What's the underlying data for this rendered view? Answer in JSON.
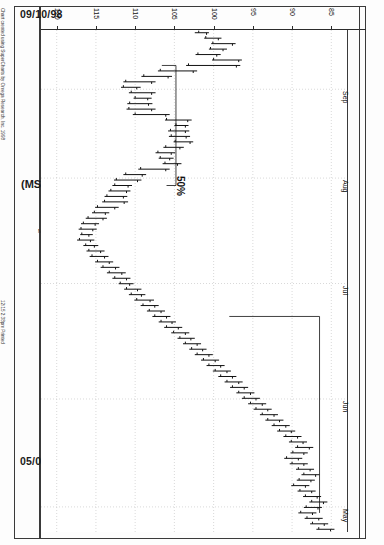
{
  "page": {
    "date_top": "09/10/98",
    "date_bottom": "05/01/98",
    "chart_title": "(MSFT) Microsoft Corp",
    "quote_line": "Microsoft Corp-Daily  12/14/98  C=127.898  -6.062  O=132.750  H=133.750  L=127.688  V=16016000",
    "copyright_a": "Chart created using SuperCharts by Omega Research, Inc. 1998",
    "copyright_b": "12/15  2:38pm  Printed"
  },
  "annotations": [
    {
      "name": "retracement-50-label",
      "text": "50%"
    }
  ],
  "chart_data": {
    "type": "bar",
    "title": "(MSFT) Microsoft Corp",
    "subtitle": "Microsoft Corp-Daily",
    "xlabel": "Date",
    "ylabel": "Price",
    "orientation": "rotated-90",
    "grid": true,
    "legend": "none",
    "price_axis": {
      "position": "top",
      "ticks": [
        120,
        115,
        110,
        105,
        100,
        95,
        90,
        85
      ],
      "limits": [
        122,
        83
      ],
      "direction": "descending-left-to-right"
    },
    "time_axis": {
      "position": "right",
      "start": "05/01/98",
      "end": "09/10/98",
      "month_ticks": [
        "Sep",
        "Aug",
        "Jul",
        "Jun",
        "May"
      ]
    },
    "quote": {
      "symbol": "MSFT",
      "name": "Microsoft Corp",
      "interval": "Daily",
      "date": "12/14/98",
      "close": 127.898,
      "change": -6.062,
      "open": 132.75,
      "high": 133.75,
      "low": 127.688,
      "volume": 16016000
    },
    "bars": [
      {
        "d": "09/10",
        "h": 102.4,
        "l": 100.6,
        "o": 101.9,
        "c": 100.9
      },
      {
        "d": "09/09",
        "h": 101.2,
        "l": 99.0,
        "o": 101.0,
        "c": 99.4
      },
      {
        "d": "09/08",
        "h": 100.3,
        "l": 97.2,
        "o": 100.1,
        "c": 97.6
      },
      {
        "d": "09/04",
        "h": 100.6,
        "l": 98.3,
        "o": 100.4,
        "c": 98.8
      },
      {
        "d": "09/03",
        "h": 102.3,
        "l": 99.1,
        "o": 102.0,
        "c": 99.6
      },
      {
        "d": "09/02",
        "h": 100.2,
        "l": 96.4,
        "o": 100.0,
        "c": 96.8
      },
      {
        "d": "09/01",
        "h": 103.5,
        "l": 96.6,
        "o": 103.2,
        "c": 97.1
      },
      {
        "d": "08/31",
        "h": 107.1,
        "l": 102.1,
        "o": 106.8,
        "c": 102.6
      },
      {
        "d": "08/28",
        "h": 109.2,
        "l": 105.3,
        "o": 108.9,
        "c": 105.8
      },
      {
        "d": "08/27",
        "h": 111.5,
        "l": 107.4,
        "o": 111.2,
        "c": 107.9
      },
      {
        "d": "08/26",
        "h": 111.8,
        "l": 109.3,
        "o": 111.5,
        "c": 109.8
      },
      {
        "d": "08/25",
        "h": 110.8,
        "l": 107.4,
        "o": 110.5,
        "c": 107.9
      },
      {
        "d": "08/24",
        "h": 110.2,
        "l": 107.9,
        "o": 110.0,
        "c": 108.4
      },
      {
        "d": "08/21",
        "h": 111.0,
        "l": 107.8,
        "o": 110.7,
        "c": 108.3
      },
      {
        "d": "08/20",
        "h": 111.1,
        "l": 107.4,
        "o": 110.8,
        "c": 107.9
      },
      {
        "d": "08/19",
        "h": 110.3,
        "l": 105.6,
        "o": 110.0,
        "c": 106.1
      },
      {
        "d": "08/18",
        "h": 106.2,
        "l": 102.8,
        "o": 106.0,
        "c": 103.3
      },
      {
        "d": "08/17",
        "h": 105.0,
        "l": 103.2,
        "o": 104.8,
        "c": 103.6
      },
      {
        "d": "08/14",
        "h": 105.8,
        "l": 103.1,
        "o": 105.5,
        "c": 103.6
      },
      {
        "d": "08/13",
        "h": 105.7,
        "l": 103.0,
        "o": 105.4,
        "c": 103.5
      },
      {
        "d": "08/12",
        "h": 105.1,
        "l": 102.6,
        "o": 104.9,
        "c": 103.0
      },
      {
        "d": "08/11",
        "h": 106.4,
        "l": 103.8,
        "o": 106.1,
        "c": 104.3
      },
      {
        "d": "08/10",
        "h": 107.4,
        "l": 104.9,
        "o": 107.1,
        "c": 105.4
      },
      {
        "d": "08/07",
        "h": 107.0,
        "l": 105.1,
        "o": 106.8,
        "c": 105.6
      },
      {
        "d": "08/06",
        "h": 106.5,
        "l": 104.1,
        "o": 106.2,
        "c": 104.6
      },
      {
        "d": "08/05",
        "h": 109.6,
        "l": 105.6,
        "o": 109.3,
        "c": 106.1
      },
      {
        "d": "08/04",
        "h": 111.5,
        "l": 108.6,
        "o": 111.2,
        "c": 109.1
      },
      {
        "d": "08/03",
        "h": 112.7,
        "l": 109.2,
        "o": 112.4,
        "c": 109.7
      },
      {
        "d": "07/31",
        "h": 112.9,
        "l": 110.4,
        "o": 112.6,
        "c": 110.9
      },
      {
        "d": "07/30",
        "h": 113.4,
        "l": 110.6,
        "o": 113.1,
        "c": 111.1
      },
      {
        "d": "07/29",
        "h": 113.9,
        "l": 111.0,
        "o": 113.6,
        "c": 111.5
      },
      {
        "d": "07/28",
        "h": 114.2,
        "l": 110.9,
        "o": 113.9,
        "c": 111.4
      },
      {
        "d": "07/27",
        "h": 115.1,
        "l": 112.1,
        "o": 114.8,
        "c": 112.6
      },
      {
        "d": "07/24",
        "h": 115.5,
        "l": 113.3,
        "o": 115.2,
        "c": 113.8
      },
      {
        "d": "07/23",
        "h": 116.3,
        "l": 113.6,
        "o": 116.0,
        "c": 114.1
      },
      {
        "d": "07/22",
        "h": 116.9,
        "l": 114.6,
        "o": 116.6,
        "c": 115.1
      },
      {
        "d": "07/21",
        "h": 117.2,
        "l": 114.9,
        "o": 116.9,
        "c": 115.4
      },
      {
        "d": "07/20",
        "h": 117.0,
        "l": 115.4,
        "o": 116.8,
        "c": 115.9
      },
      {
        "d": "07/17",
        "h": 117.4,
        "l": 115.2,
        "o": 117.1,
        "c": 115.7
      },
      {
        "d": "07/16",
        "h": 116.6,
        "l": 114.7,
        "o": 116.3,
        "c": 115.2
      },
      {
        "d": "07/15",
        "h": 116.2,
        "l": 113.9,
        "o": 115.9,
        "c": 114.4
      },
      {
        "d": "07/14",
        "h": 115.8,
        "l": 113.4,
        "o": 115.5,
        "c": 113.9
      },
      {
        "d": "07/13",
        "h": 115.1,
        "l": 112.8,
        "o": 114.8,
        "c": 113.3
      },
      {
        "d": "07/10",
        "h": 114.4,
        "l": 112.0,
        "o": 114.1,
        "c": 112.5
      },
      {
        "d": "07/09",
        "h": 113.6,
        "l": 111.2,
        "o": 113.3,
        "c": 111.7
      },
      {
        "d": "07/08",
        "h": 112.9,
        "l": 110.6,
        "o": 112.6,
        "c": 111.1
      },
      {
        "d": "07/07",
        "h": 112.1,
        "l": 110.2,
        "o": 111.9,
        "c": 110.7
      },
      {
        "d": "07/06",
        "h": 111.4,
        "l": 109.2,
        "o": 111.1,
        "c": 109.7
      },
      {
        "d": "07/02",
        "h": 110.8,
        "l": 108.7,
        "o": 110.5,
        "c": 109.2
      },
      {
        "d": "07/01",
        "h": 110.1,
        "l": 107.6,
        "o": 109.8,
        "c": 108.1
      },
      {
        "d": "06/30",
        "h": 109.3,
        "l": 107.0,
        "o": 109.0,
        "c": 107.5
      },
      {
        "d": "06/29",
        "h": 108.5,
        "l": 106.2,
        "o": 108.2,
        "c": 106.7
      },
      {
        "d": "06/26",
        "h": 107.8,
        "l": 105.5,
        "o": 107.5,
        "c": 106.0
      },
      {
        "d": "06/25",
        "h": 107.0,
        "l": 104.8,
        "o": 106.7,
        "c": 105.3
      },
      {
        "d": "06/24",
        "h": 106.3,
        "l": 104.0,
        "o": 106.0,
        "c": 104.5
      },
      {
        "d": "06/23",
        "h": 105.4,
        "l": 103.1,
        "o": 105.1,
        "c": 103.6
      },
      {
        "d": "06/22",
        "h": 104.6,
        "l": 102.4,
        "o": 104.3,
        "c": 102.9
      },
      {
        "d": "06/19",
        "h": 103.9,
        "l": 101.6,
        "o": 103.6,
        "c": 102.1
      },
      {
        "d": "06/18",
        "h": 103.1,
        "l": 100.9,
        "o": 102.8,
        "c": 101.4
      },
      {
        "d": "06/17",
        "h": 102.4,
        "l": 100.1,
        "o": 102.1,
        "c": 100.6
      },
      {
        "d": "06/16",
        "h": 101.6,
        "l": 99.3,
        "o": 101.3,
        "c": 99.8
      },
      {
        "d": "06/15",
        "h": 100.9,
        "l": 98.6,
        "o": 100.6,
        "c": 99.1
      },
      {
        "d": "06/12",
        "h": 100.1,
        "l": 97.8,
        "o": 99.8,
        "c": 98.3
      },
      {
        "d": "06/11",
        "h": 99.4,
        "l": 97.1,
        "o": 99.1,
        "c": 97.6
      },
      {
        "d": "06/10",
        "h": 98.6,
        "l": 96.3,
        "o": 98.3,
        "c": 96.8
      },
      {
        "d": "06/09",
        "h": 97.9,
        "l": 95.6,
        "o": 97.6,
        "c": 96.1
      },
      {
        "d": "06/08",
        "h": 97.1,
        "l": 94.8,
        "o": 96.8,
        "c": 95.3
      },
      {
        "d": "06/05",
        "h": 96.4,
        "l": 94.1,
        "o": 96.1,
        "c": 94.6
      },
      {
        "d": "06/04",
        "h": 95.6,
        "l": 93.3,
        "o": 95.3,
        "c": 93.8
      },
      {
        "d": "06/03",
        "h": 94.9,
        "l": 92.6,
        "o": 94.6,
        "c": 93.1
      },
      {
        "d": "06/02",
        "h": 94.1,
        "l": 91.8,
        "o": 93.8,
        "c": 92.3
      },
      {
        "d": "06/01",
        "h": 93.4,
        "l": 91.1,
        "o": 93.1,
        "c": 91.6
      },
      {
        "d": "05/29",
        "h": 92.6,
        "l": 90.3,
        "o": 92.3,
        "c": 90.8
      },
      {
        "d": "05/28",
        "h": 91.9,
        "l": 89.6,
        "o": 91.6,
        "c": 90.1
      },
      {
        "d": "05/27",
        "h": 91.1,
        "l": 88.8,
        "o": 90.8,
        "c": 89.3
      },
      {
        "d": "05/26",
        "h": 90.4,
        "l": 88.1,
        "o": 90.1,
        "c": 88.6
      },
      {
        "d": "05/22",
        "h": 89.6,
        "l": 87.3,
        "o": 89.3,
        "c": 87.8
      },
      {
        "d": "05/21",
        "h": 90.2,
        "l": 88.0,
        "o": 89.9,
        "c": 88.5
      },
      {
        "d": "05/20",
        "h": 91.0,
        "l": 88.7,
        "o": 90.7,
        "c": 89.2
      },
      {
        "d": "05/19",
        "h": 90.3,
        "l": 88.0,
        "o": 90.0,
        "c": 88.5
      },
      {
        "d": "05/18",
        "h": 89.5,
        "l": 87.2,
        "o": 89.2,
        "c": 87.7
      },
      {
        "d": "05/15",
        "h": 88.8,
        "l": 86.5,
        "o": 88.5,
        "c": 87.0
      },
      {
        "d": "05/14",
        "h": 89.4,
        "l": 87.1,
        "o": 89.1,
        "c": 87.6
      },
      {
        "d": "05/13",
        "h": 90.1,
        "l": 87.8,
        "o": 89.8,
        "c": 88.3
      },
      {
        "d": "05/12",
        "h": 89.3,
        "l": 87.0,
        "o": 89.0,
        "c": 87.5
      },
      {
        "d": "05/11",
        "h": 88.6,
        "l": 86.3,
        "o": 88.3,
        "c": 86.8
      },
      {
        "d": "05/08",
        "h": 87.8,
        "l": 85.5,
        "o": 87.5,
        "c": 86.0
      },
      {
        "d": "05/07",
        "h": 88.5,
        "l": 86.2,
        "o": 88.2,
        "c": 86.7
      },
      {
        "d": "05/06",
        "h": 89.2,
        "l": 86.9,
        "o": 88.9,
        "c": 87.4
      },
      {
        "d": "05/05",
        "h": 88.4,
        "l": 86.1,
        "o": 88.1,
        "c": 86.6
      },
      {
        "d": "05/04",
        "h": 87.7,
        "l": 85.4,
        "o": 87.4,
        "c": 85.9
      },
      {
        "d": "05/01",
        "h": 86.9,
        "l": 84.6,
        "o": 86.6,
        "c": 85.1
      }
    ],
    "retracement_line": {
      "label": "50%",
      "price": 104.8
    }
  },
  "colors": {
    "bar": "#111111",
    "grid": "#c9c9c9",
    "frame": "#3a3a3a",
    "background": "#ffffff"
  }
}
